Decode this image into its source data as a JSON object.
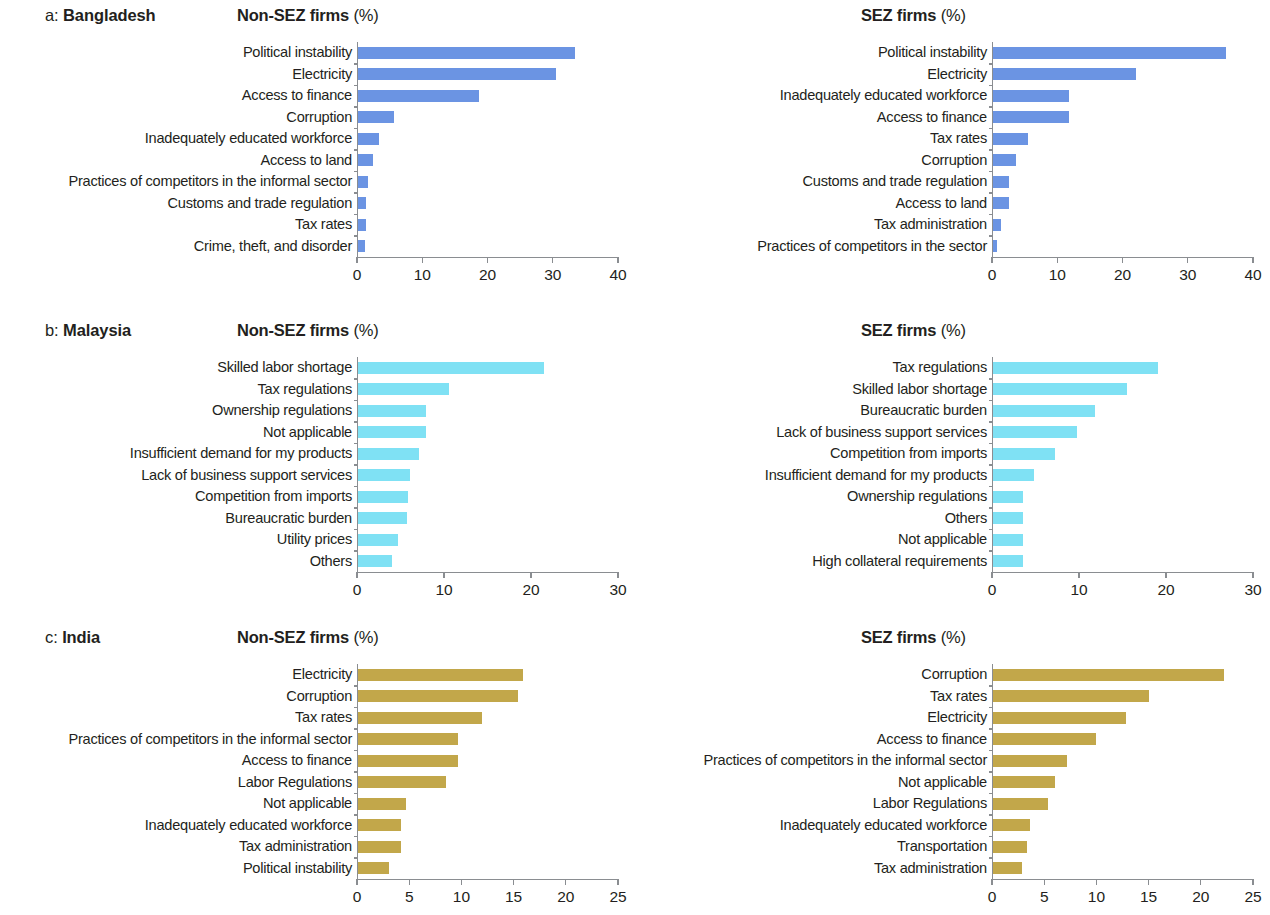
{
  "figure": {
    "panel_title_nonsez": "Non-SEZ firms",
    "panel_title_sez": "SEZ firms",
    "percent_suffix": "(%)",
    "colors": {
      "bangladesh": "#6b94e3",
      "malaysia": "#7fe1f4",
      "india": "#c2a74a",
      "axis": "#8a8d91",
      "text": "#231f20"
    }
  },
  "panels": [
    {
      "letter": "a:",
      "country": "Bangladesh"
    },
    {
      "letter": "b:",
      "country": "Malaysia"
    },
    {
      "letter": "c:",
      "country": "India"
    }
  ],
  "chart_data": [
    {
      "type": "bar",
      "orientation": "horizontal",
      "panel": "a",
      "title": "Non-SEZ firms (%)",
      "country": "Bangladesh",
      "group": "Non-SEZ firms",
      "xlabel": "",
      "ylabel": "",
      "xlim": [
        0,
        40
      ],
      "xticks": [
        0,
        10,
        20,
        30,
        40
      ],
      "grid": false,
      "legend": "none",
      "color": "#6b94e3",
      "categories": [
        "Political instability",
        "Electricity",
        "Access to finance",
        "Corruption",
        "Inadequately educated workforce",
        "Access to land",
        "Practices of competitors in the informal sector",
        "Customs and trade regulation",
        "Tax rates",
        "Crime, theft, and disorder"
      ],
      "values": [
        33.2,
        30.3,
        18.5,
        5.5,
        3.2,
        2.3,
        1.6,
        1.3,
        1.2,
        1.1
      ]
    },
    {
      "type": "bar",
      "orientation": "horizontal",
      "panel": "a",
      "title": "SEZ firms (%)",
      "country": "Bangladesh",
      "group": "SEZ firms",
      "xlabel": "",
      "ylabel": "",
      "xlim": [
        0,
        40
      ],
      "xticks": [
        0,
        10,
        20,
        30,
        40
      ],
      "grid": false,
      "legend": "none",
      "color": "#6b94e3",
      "categories": [
        "Political instability",
        "Electricity",
        "Inadequately educated workforce",
        "Access to finance",
        "Tax rates",
        "Corruption",
        "Customs and trade regulation",
        "Access to land",
        "Tax administration",
        "Practices of competitors in the sector"
      ],
      "values": [
        35.7,
        21.9,
        11.6,
        11.6,
        5.4,
        3.6,
        2.4,
        2.4,
        1.2,
        0.6
      ]
    },
    {
      "type": "bar",
      "orientation": "horizontal",
      "panel": "b",
      "title": "Non-SEZ firms (%)",
      "country": "Malaysia",
      "group": "Non-SEZ firms",
      "xlabel": "",
      "ylabel": "",
      "xlim": [
        0,
        30
      ],
      "xticks": [
        0,
        10,
        20,
        30
      ],
      "grid": false,
      "legend": "none",
      "color": "#7fe1f4",
      "categories": [
        "Skilled labor shortage",
        "Tax regulations",
        "Ownership regulations",
        "Not applicable",
        "Insufficient demand for my products",
        "Lack of business support services",
        "Competition from imports",
        "Bureaucratic burden",
        "Utility prices",
        "Others"
      ],
      "values": [
        21.4,
        10.5,
        7.8,
        7.8,
        7.0,
        6.0,
        5.7,
        5.6,
        4.6,
        3.9
      ]
    },
    {
      "type": "bar",
      "orientation": "horizontal",
      "panel": "b",
      "title": "SEZ firms (%)",
      "country": "Malaysia",
      "group": "SEZ firms",
      "xlabel": "",
      "ylabel": "",
      "xlim": [
        0,
        30
      ],
      "xticks": [
        0,
        10,
        20,
        30
      ],
      "grid": false,
      "legend": "none",
      "color": "#7fe1f4",
      "categories": [
        "Tax regulations",
        "Skilled labor shortage",
        "Bureaucratic burden",
        "Lack of business support services",
        "Competition from imports",
        "Insufficient demand for my products",
        "Ownership regulations",
        "Others",
        "Not applicable",
        "High collateral requirements"
      ],
      "values": [
        19.0,
        15.4,
        11.7,
        9.6,
        7.1,
        4.7,
        3.5,
        3.5,
        3.5,
        3.5
      ]
    },
    {
      "type": "bar",
      "orientation": "horizontal",
      "panel": "c",
      "title": "Non-SEZ firms (%)",
      "country": "India",
      "group": "Non-SEZ firms",
      "xlabel": "",
      "ylabel": "",
      "xlim": [
        0,
        25
      ],
      "xticks": [
        0,
        5,
        10,
        15,
        20,
        25
      ],
      "grid": false,
      "legend": "none",
      "color": "#c2a74a",
      "categories": [
        "Electricity",
        "Corruption",
        "Tax rates",
        "Practices of competitors in the informal sector",
        "Access to finance",
        "Labor Regulations",
        "Not applicable",
        "Inadequately educated workforce",
        "Tax administration",
        "Political instability"
      ],
      "values": [
        15.8,
        15.3,
        11.9,
        9.6,
        9.6,
        8.4,
        4.6,
        4.1,
        4.1,
        3.0
      ]
    },
    {
      "type": "bar",
      "orientation": "horizontal",
      "panel": "c",
      "title": "SEZ firms (%)",
      "country": "India",
      "group": "SEZ firms",
      "xlabel": "",
      "ylabel": "",
      "xlim": [
        0,
        25
      ],
      "xticks": [
        0,
        5,
        10,
        15,
        20,
        25
      ],
      "grid": false,
      "legend": "none",
      "color": "#c2a74a",
      "categories": [
        "Corruption",
        "Tax rates",
        "Electricity",
        "Access to finance",
        "Practices of competitors in the informal sector",
        "Not applicable",
        "Labor Regulations",
        "Inadequately educated workforce",
        "Transportation",
        "Tax administration"
      ],
      "values": [
        22.1,
        14.9,
        12.7,
        9.9,
        7.1,
        5.9,
        5.3,
        3.5,
        3.3,
        2.8
      ]
    }
  ]
}
